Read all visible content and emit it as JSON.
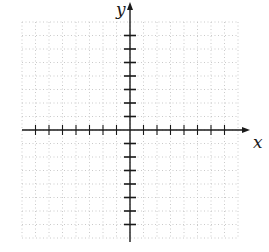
{
  "diagram": {
    "type": "coordinate-plane",
    "x_axis_label": "x",
    "y_axis_label": "y",
    "origin_px": [
      130,
      130
    ],
    "unit_px": 13.5,
    "x_tick_range": [
      -7,
      7
    ],
    "y_tick_range": [
      -7,
      7
    ],
    "grid_range": [
      -8,
      8
    ],
    "x_axis_extent_px": [
      22,
      250
    ],
    "y_axis_extent_px": [
      2,
      242
    ],
    "colors": {
      "axis": "#1a1a1a",
      "grid": "#bdbdbd",
      "background": "#ffffff"
    }
  }
}
